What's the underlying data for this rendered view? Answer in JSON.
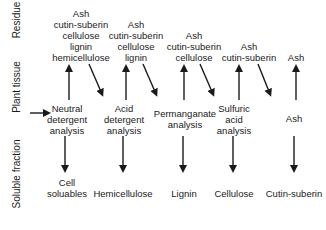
{
  "row_labels": {
    "residue": "Residue",
    "plant_tissue": "Plant tissue",
    "soluble_fraction": "Soluble fraction"
  },
  "columns": [
    {
      "residue": [
        "Ash",
        "cutin-suberin",
        "cellulose",
        "lignin",
        "hemicellulose"
      ],
      "analysis": [
        "Neutral",
        "detergent",
        "analysis"
      ],
      "soluble": [
        "Cell",
        "soluables"
      ]
    },
    {
      "residue": [
        "Ash",
        "cutin-suberin",
        "cellulose",
        "lignin"
      ],
      "analysis": [
        "Acid",
        "detergent",
        "analysis"
      ],
      "soluble": [
        "Hemicellulose"
      ]
    },
    {
      "residue": [
        "Ash",
        "cutin-suberin",
        "cellulose"
      ],
      "analysis": [
        "Permanganate",
        "analysis"
      ],
      "soluble": [
        "Lignin"
      ]
    },
    {
      "residue": [
        "Ash",
        "cutin-suberin"
      ],
      "analysis": [
        "Sulfuric",
        "acid",
        "analysis"
      ],
      "soluble": [
        "Cellulose"
      ]
    },
    {
      "residue": [
        "Ash"
      ],
      "analysis": [
        "Ash"
      ],
      "soluble": [
        "Cutin-suberin"
      ]
    }
  ]
}
